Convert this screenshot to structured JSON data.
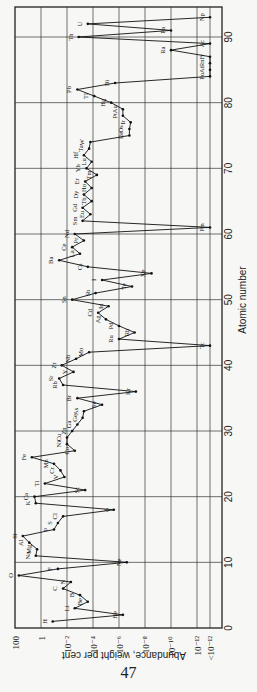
{
  "page_number": "47",
  "chart_data": {
    "type": "line",
    "title": "",
    "xlabel": "Atomic number",
    "ylabel": "Abundance, weight per cent",
    "orientation": "rotated 90° counterclockwise",
    "xlim": [
      0,
      94
    ],
    "x_ticks": [
      0,
      10,
      20,
      30,
      40,
      50,
      60,
      70,
      80,
      90
    ],
    "y_scale": "log",
    "y_ticks_log10": [
      2,
      0,
      -2,
      -4,
      -6,
      -8,
      -10,
      -12,
      -13
    ],
    "y_tick_labels": [
      "100",
      "1",
      "10⁻²",
      "10⁻⁴",
      "10⁻⁶",
      "10⁻⁸",
      "10⁻¹⁰",
      "10⁻¹²",
      "<10⁻¹²"
    ],
    "grid": true,
    "series": [
      {
        "name": "Element abundance (log10 weight %)",
        "points": [
          {
            "z": 1,
            "el": "H",
            "v": -0.9
          },
          {
            "z": 2,
            "el": "He",
            "v": -6.3
          },
          {
            "z": 3,
            "el": "Li",
            "v": -2.6
          },
          {
            "z": 4,
            "el": "Be",
            "v": -3.6
          },
          {
            "z": 5,
            "el": "B",
            "v": -3.0
          },
          {
            "z": 6,
            "el": "C",
            "v": -1.7
          },
          {
            "z": 7,
            "el": "N",
            "v": -2.3
          },
          {
            "z": 8,
            "el": "O",
            "v": 1.7
          },
          {
            "z": 9,
            "el": "F",
            "v": -1.3
          },
          {
            "z": 10,
            "el": "Ne",
            "v": -6.6
          },
          {
            "z": 11,
            "el": "Na",
            "v": 0.4
          },
          {
            "z": 12,
            "el": "Mg",
            "v": 0.3
          },
          {
            "z": 13,
            "el": "Al",
            "v": 0.9
          },
          {
            "z": 14,
            "el": "Si",
            "v": 1.4
          },
          {
            "z": 15,
            "el": "P",
            "v": -1.0
          },
          {
            "z": 16,
            "el": "S",
            "v": -1.3
          },
          {
            "z": 17,
            "el": "Cl",
            "v": -1.7
          },
          {
            "z": 18,
            "el": "A",
            "v": -5.6
          },
          {
            "z": 19,
            "el": "K",
            "v": 0.4
          },
          {
            "z": 20,
            "el": "Ca",
            "v": 0.5
          },
          {
            "z": 21,
            "el": "Sc",
            "v": -3.4
          },
          {
            "z": 22,
            "el": "Ti",
            "v": -0.3
          },
          {
            "z": 23,
            "el": "V",
            "v": -1.8
          },
          {
            "z": 24,
            "el": "Cr",
            "v": -1.5
          },
          {
            "z": 25,
            "el": "Mn",
            "v": -1.0
          },
          {
            "z": 26,
            "el": "Fe",
            "v": 0.7
          },
          {
            "z": 27,
            "el": "Co",
            "v": -2.6
          },
          {
            "z": 28,
            "el": "Ni",
            "v": -2.0
          },
          {
            "z": 29,
            "el": "Cu",
            "v": -2.0
          },
          {
            "z": 30,
            "el": "Zn",
            "v": -2.4
          },
          {
            "z": 31,
            "el": "Ga",
            "v": -2.8
          },
          {
            "z": 32,
            "el": "Ge",
            "v": -3.2
          },
          {
            "z": 33,
            "el": "As",
            "v": -3.3
          },
          {
            "z": 34,
            "el": "Se",
            "v": -4.7
          },
          {
            "z": 35,
            "el": "Br",
            "v": -2.8
          },
          {
            "z": 36,
            "el": "Kr",
            "v": -7.3
          },
          {
            "z": 37,
            "el": "Rb",
            "v": -1.7
          },
          {
            "z": 38,
            "el": "Sr",
            "v": -1.4
          },
          {
            "z": 39,
            "el": "Y",
            "v": -2.5
          },
          {
            "z": 40,
            "el": "Zr",
            "v": -1.6
          },
          {
            "z": 41,
            "el": "Nb",
            "v": -2.7
          },
          {
            "z": 42,
            "el": "Mo",
            "v": -3.7
          },
          {
            "z": 43,
            "el": "Tc",
            "v": -13.0
          },
          {
            "z": 44,
            "el": "Ru",
            "v": -6.0
          },
          {
            "z": 45,
            "el": "Rh",
            "v": -7.2
          },
          {
            "z": 46,
            "el": "Pd",
            "v": -6.0
          },
          {
            "z": 47,
            "el": "Ag",
            "v": -5.0
          },
          {
            "z": 48,
            "el": "Cd",
            "v": -4.4
          },
          {
            "z": 49,
            "el": "In",
            "v": -5.2
          },
          {
            "z": 50,
            "el": "Sn",
            "v": -2.4
          },
          {
            "z": 51,
            "el": "Sb",
            "v": -4.2
          },
          {
            "z": 52,
            "el": "Te",
            "v": -7.0
          },
          {
            "z": 53,
            "el": "I",
            "v": -4.7
          },
          {
            "z": 54,
            "el": "Xe",
            "v": -8.5
          },
          {
            "z": 55,
            "el": "Cs",
            "v": -3.6
          },
          {
            "z": 56,
            "el": "Ba",
            "v": -1.4
          },
          {
            "z": 57,
            "el": "La",
            "v": -3.0
          },
          {
            "z": 58,
            "el": "Ce",
            "v": -2.4
          },
          {
            "z": 59,
            "el": "Pr",
            "v": -3.3
          },
          {
            "z": 60,
            "el": "Nd",
            "v": -2.6
          },
          {
            "z": 61,
            "el": "Pm",
            "v": -13.0
          },
          {
            "z": 62,
            "el": "Sm",
            "v": -3.2
          },
          {
            "z": 63,
            "el": "Eu",
            "v": -3.8
          },
          {
            "z": 64,
            "el": "Gd",
            "v": -3.2
          },
          {
            "z": 65,
            "el": "Tb",
            "v": -3.9
          },
          {
            "z": 66,
            "el": "Dy",
            "v": -3.3
          },
          {
            "z": 67,
            "el": "Ho",
            "v": -3.9
          },
          {
            "z": 68,
            "el": "Er",
            "v": -3.4
          },
          {
            "z": 69,
            "el": "Tm",
            "v": -4.3
          },
          {
            "z": 70,
            "el": "Yb",
            "v": -3.5
          },
          {
            "z": 71,
            "el": "Lu",
            "v": -3.9
          },
          {
            "z": 72,
            "el": "Hf",
            "v": -3.3
          },
          {
            "z": 73,
            "el": "Ta",
            "v": -3.7
          },
          {
            "z": 74,
            "el": "W",
            "v": -3.8
          },
          {
            "z": 75,
            "el": "Re",
            "v": -6.8
          },
          {
            "z": 76,
            "el": "Os",
            "v": -6.8
          },
          {
            "z": 77,
            "el": "Ir",
            "v": -6.9
          },
          {
            "z": 78,
            "el": "Pt",
            "v": -6.3
          },
          {
            "z": 79,
            "el": "Au",
            "v": -6.3
          },
          {
            "z": 80,
            "el": "Hg",
            "v": -5.4
          },
          {
            "z": 81,
            "el": "Tl",
            "v": -4.1
          },
          {
            "z": 82,
            "el": "Pb",
            "v": -2.8
          },
          {
            "z": 83,
            "el": "Bi",
            "v": -5.7
          },
          {
            "z": 84,
            "el": "Po",
            "v": -13.0
          },
          {
            "z": 85,
            "el": "At",
            "v": -13.0
          },
          {
            "z": 86,
            "el": "Rn",
            "v": -13.0
          },
          {
            "z": 87,
            "el": "Fr",
            "v": -13.0
          },
          {
            "z": 88,
            "el": "Ra",
            "v": -10.0
          },
          {
            "z": 89,
            "el": "Ac",
            "v": -13.0
          },
          {
            "z": 90,
            "el": "Th",
            "v": -2.9
          },
          {
            "z": 91,
            "el": "Pa",
            "v": -10.0
          },
          {
            "z": 92,
            "el": "U",
            "v": -3.6
          },
          {
            "z": 93,
            "el": "Np",
            "v": -13.0
          }
        ]
      }
    ]
  }
}
